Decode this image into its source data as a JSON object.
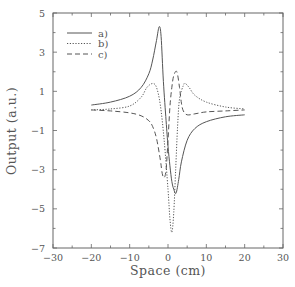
{
  "chart_data": {
    "type": "line",
    "title": "",
    "xlabel": "Space (cm)",
    "ylabel": "Output (a.u.)",
    "xlim": [
      -30,
      30
    ],
    "ylim": [
      -7,
      5
    ],
    "xticks": [
      -30,
      -20,
      -10,
      0,
      10,
      20,
      30
    ],
    "yticks": [
      5,
      3,
      1,
      -1,
      -3,
      -5,
      -7
    ],
    "xtick_labels": [
      "−30",
      "−20",
      "−10",
      "0",
      "10",
      "20",
      "30"
    ],
    "ytick_labels": [
      "5",
      "3",
      "1",
      "−1",
      "−3",
      "−5",
      "−7"
    ],
    "grid": false,
    "legend_position": "upper left",
    "series": [
      {
        "name": "a)",
        "style": "solid",
        "x": [
          -20,
          -15,
          -10,
          -7,
          -5,
          -4,
          -3,
          -2.3,
          -1.8,
          -1.2,
          -0.5,
          0,
          0.5,
          1,
          1.5,
          2.1,
          2.8,
          3.5,
          5,
          7,
          10,
          15,
          20
        ],
        "y": [
          0.3,
          0.45,
          0.75,
          1.2,
          1.9,
          2.6,
          3.6,
          4.3,
          3.8,
          1.5,
          -0.5,
          -1.8,
          -2.8,
          -3.6,
          -4.0,
          -4.2,
          -3.5,
          -2.6,
          -1.5,
          -0.9,
          -0.55,
          -0.3,
          -0.2
        ]
      },
      {
        "name": "b)",
        "style": "dotted",
        "x": [
          -20,
          -15,
          -10,
          -7,
          -5.5,
          -4,
          -3,
          -2,
          -1,
          0,
          0.5,
          1,
          1.5,
          2,
          2.5,
          3,
          4,
          4.5,
          5.5,
          7,
          10,
          15,
          20
        ],
        "y": [
          0.05,
          0.1,
          0.25,
          0.7,
          1.2,
          1.4,
          1.2,
          0.3,
          -1.5,
          -4.0,
          -5.5,
          -6.2,
          -5.2,
          -3.0,
          -0.8,
          0.6,
          1.3,
          1.4,
          1.2,
          0.8,
          0.45,
          0.2,
          0.1
        ]
      },
      {
        "name": "c)",
        "style": "dashed",
        "x": [
          -20,
          -15,
          -10,
          -7,
          -5,
          -4,
          -3,
          -2,
          -1.5,
          -1,
          -0.5,
          0,
          0.5,
          1,
          1.5,
          2.3,
          3,
          3.5,
          4,
          5,
          7,
          10,
          15,
          20
        ],
        "y": [
          0.05,
          0.0,
          -0.1,
          -0.25,
          -0.5,
          -0.8,
          -1.4,
          -2.5,
          -3.2,
          -3.4,
          -3.0,
          -1.5,
          0.2,
          1.2,
          1.8,
          2.0,
          1.2,
          0.4,
          0.0,
          -0.2,
          -0.15,
          -0.05,
          0.0,
          0.05
        ]
      }
    ]
  },
  "legend": {
    "items": [
      {
        "label": "a)",
        "style": "solid"
      },
      {
        "label": "b)",
        "style": "dotted"
      },
      {
        "label": "c)",
        "style": "dashed"
      }
    ]
  },
  "colors": {
    "axis": "#666666",
    "line": "#555555",
    "text": "#555555"
  }
}
